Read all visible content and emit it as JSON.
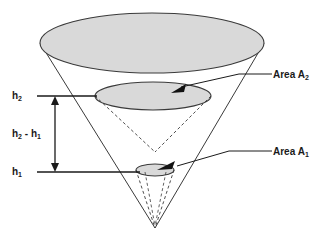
{
  "diagram": {
    "background_color": "#ffffff",
    "stroke_color": "#3a3a3a",
    "fill_color": "#d9d9d9",
    "text_color": "#1a1a1a",
    "labels": {
      "h2": {
        "base": "h",
        "sub": "2",
        "full": "h2"
      },
      "h_diff": {
        "base": "h",
        "sub": "2",
        "mid": " - h",
        "sub2": "1",
        "full": "h2 - h1"
      },
      "h1": {
        "base": "h",
        "sub": "1",
        "full": "h1"
      },
      "area2": {
        "base": "Area A",
        "sub": "2",
        "full": "Area A2"
      },
      "area1": {
        "base": "Area A",
        "sub": "1",
        "full": "Area A1"
      }
    },
    "elements": {
      "top_ellipse": {
        "cx": 152,
        "cy": 43,
        "rx": 112,
        "ry": 30
      },
      "mid_ellipse": {
        "cx": 153,
        "cy": 96,
        "rx": 58,
        "ry": 14
      },
      "small_ellipse": {
        "cx": 155,
        "cy": 170,
        "rx": 19,
        "ry": 6
      },
      "cone_apex": {
        "x": 155,
        "y": 228
      },
      "mid_dashed_apex": {
        "x": 155,
        "y": 152
      },
      "h2_level_y": 96,
      "h1_level_y": 172,
      "dimension_arrow_x": 55
    }
  }
}
